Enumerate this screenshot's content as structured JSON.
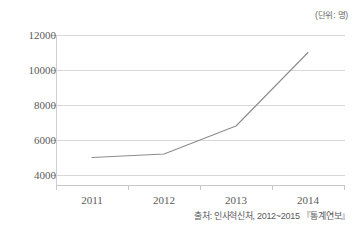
{
  "figure": {
    "top_clipped_text": "",
    "unit_label": "(단위: 명)",
    "source_note": "출처: 인사혁신처, 2012~2015 『통계연보』"
  },
  "chart_data": {
    "type": "line",
    "title": "",
    "subtitle": "",
    "xlabel": "",
    "ylabel": "",
    "unit": "(단위: 명)",
    "categories": [
      "2011",
      "2012",
      "2013",
      "2014"
    ],
    "values": [
      5000,
      5200,
      6800,
      11000
    ],
    "series": [
      {
        "name": "인원",
        "values": [
          5000,
          5200,
          6800,
          11000
        ]
      }
    ],
    "ylim": [
      3000,
      12000
    ],
    "ytick_labels": [
      "12000",
      "10000",
      "8000",
      "6000",
      "4000"
    ],
    "ytick_values": [
      12000,
      10000,
      8000,
      6000,
      4000
    ],
    "xtick_labels": [
      "2011",
      "2012",
      "2013",
      "2014"
    ],
    "grid": "horizontal",
    "legend": "none",
    "line_color": "#8c8c8c",
    "grid_color": "#d8d8d8",
    "axis_color": "#c9c9c9",
    "text_color": "#5a5a5a",
    "background": "#ffffff",
    "source": "출처: 인사혁신처, 2012~2015 『통계연보』"
  }
}
